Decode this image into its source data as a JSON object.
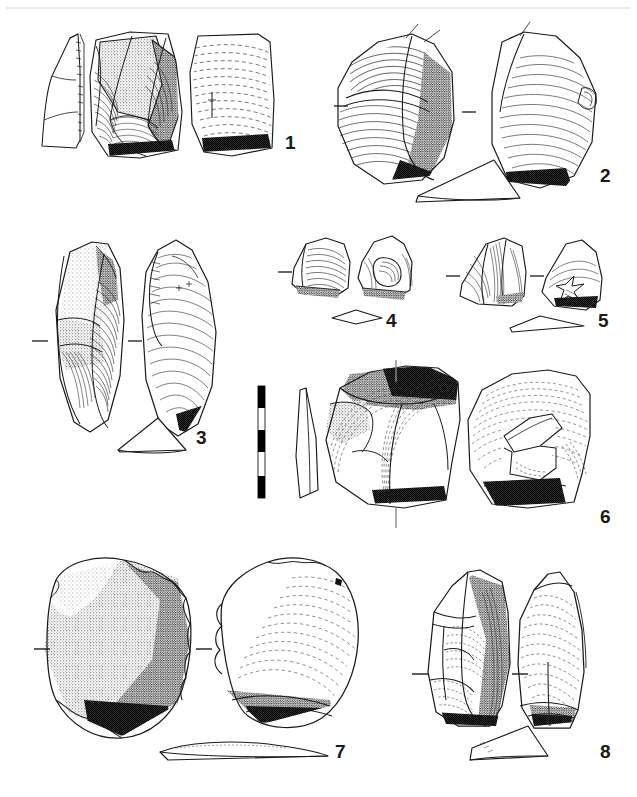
{
  "figure": {
    "type": "archaeological-lithic-plate",
    "background_color": "#ffffff",
    "ink_color": "#1a1a1a",
    "top_rule": true,
    "caption_text": "",
    "scale_bar": {
      "name": "scale-bar",
      "orientation": "vertical",
      "segments": 5,
      "segment_colors": [
        "#000000",
        "#ffffff",
        "#000000",
        "#ffffff",
        "#000000"
      ],
      "x": 258,
      "y": 386,
      "width": 7,
      "height": 112
    },
    "artifacts": [
      {
        "id": 1,
        "label": "1",
        "label_x": 285,
        "label_y": 133,
        "views": [
          "profile-section",
          "dorsal-face",
          "ventral-face"
        ],
        "tick_marks": [],
        "description": "flake with cortex patch and radial ripple hatching"
      },
      {
        "id": 2,
        "label": "2",
        "label_x": 600,
        "label_y": 166,
        "views": [
          "dorsal-face",
          "ventral-face",
          "transverse-section"
        ],
        "tick_marks": [
          "left",
          "middle"
        ],
        "description": "broad flake, stippled cortex along right margin"
      },
      {
        "id": 3,
        "label": "3",
        "label_x": 196,
        "label_y": 428,
        "views": [
          "dorsal-face",
          "ventral-face",
          "transverse-section"
        ],
        "tick_marks": [
          "left",
          "middle"
        ],
        "description": "elongated blade-like flake with stippled cortex"
      },
      {
        "id": 4,
        "label": "4",
        "label_x": 386,
        "label_y": 311,
        "views": [
          "dorsal-face",
          "ventral-face",
          "transverse-section"
        ],
        "tick_marks": [
          "left"
        ],
        "description": "small flake with bulb of percussion"
      },
      {
        "id": 5,
        "label": "5",
        "label_x": 598,
        "label_y": 311,
        "views": [
          "dorsal-face",
          "ventral-face",
          "transverse-section"
        ],
        "tick_marks": [
          "left",
          "middle"
        ],
        "description": "small triangular flake"
      },
      {
        "id": 6,
        "label": "6",
        "label_x": 600,
        "label_y": 507,
        "views": [
          "longitudinal-section",
          "dorsal-face",
          "ventral-face"
        ],
        "tick_marks": [
          "top-vertical",
          "bottom-vertical"
        ],
        "description": "core/levallois flake, dark stippled platform"
      },
      {
        "id": 7,
        "label": "7",
        "label_x": 335,
        "label_y": 742,
        "views": [
          "dorsal-face",
          "ventral-face",
          "transverse-section"
        ],
        "tick_marks": [
          "left",
          "middle"
        ],
        "description": "large cortical flake, heavy stipple shading"
      },
      {
        "id": 8,
        "label": "8",
        "label_x": 600,
        "label_y": 742,
        "views": [
          "dorsal-face",
          "ventral-face",
          "transverse-section"
        ],
        "tick_marks": [
          "left",
          "middle"
        ],
        "description": "pointed flake with faceted dorsal surface"
      }
    ]
  }
}
